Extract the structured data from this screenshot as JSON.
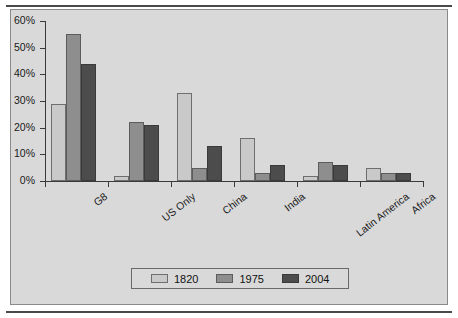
{
  "figure": {
    "cropped_title_fragment": "",
    "plate_color": "#d9d9d9",
    "rule_color": "#4a4a4a"
  },
  "chart_data": {
    "type": "bar",
    "title": "",
    "xlabel": "",
    "ylabel": "",
    "ylim": [
      0,
      60
    ],
    "ytick_values": [
      0,
      10,
      20,
      30,
      40,
      50,
      60
    ],
    "ytick_labels": [
      "0%",
      "10%",
      "20%",
      "30%",
      "40%",
      "50%",
      "60%"
    ],
    "grid": false,
    "legend_position": "bottom",
    "categories": [
      "G8",
      "US Only",
      "China",
      "India",
      "Latin America",
      "Africa"
    ],
    "series": [
      {
        "name": "1820",
        "color": "#c9c9c9",
        "values": [
          29,
          2,
          33,
          16,
          2,
          5
        ]
      },
      {
        "name": "1975",
        "color": "#8e8e8e",
        "values": [
          55,
          22,
          5,
          3,
          7,
          3
        ]
      },
      {
        "name": "2004",
        "color": "#4c4c4c",
        "values": [
          44,
          21,
          13,
          6,
          6,
          3
        ]
      }
    ]
  }
}
